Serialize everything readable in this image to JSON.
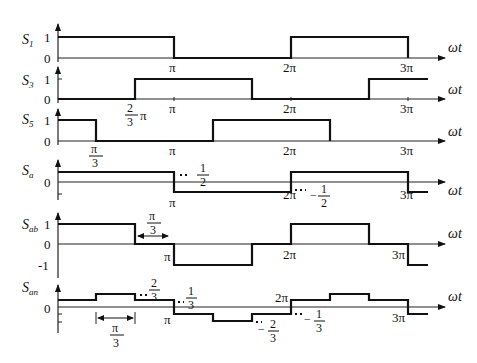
{
  "diagram": {
    "axis_label": "ωt",
    "x_ticks": [
      "π",
      "2π",
      "3π"
    ],
    "panels": [
      {
        "id": "S1",
        "label_main": "S",
        "label_sub": "1",
        "y_ticks": [
          "1",
          "0"
        ],
        "levels": [
          1,
          0,
          1,
          0
        ],
        "breakpoints": [
          "0",
          "π",
          "2π",
          "3π"
        ]
      },
      {
        "id": "S3",
        "label_main": "S",
        "label_sub": "3",
        "y_ticks": [
          "1",
          "0"
        ],
        "annotation": "2/3 π",
        "annotation_num": "2",
        "annotation_den": "3",
        "annotation_suffix": "π"
      },
      {
        "id": "S5",
        "label_main": "S",
        "label_sub": "5",
        "y_ticks": [
          "1",
          "0"
        ],
        "annotation": "π/3",
        "annotation_num": "π",
        "annotation_den": "3"
      },
      {
        "id": "Sa",
        "label_main": "S",
        "label_sub": "a",
        "y_ticks": [
          "0"
        ],
        "annotation_pos": "1/2",
        "annotation_pos_num": "1",
        "annotation_pos_den": "2",
        "annotation_neg": "-1/2",
        "annotation_neg_sign": "−",
        "annotation_neg_num": "1",
        "annotation_neg_den": "2"
      },
      {
        "id": "Sab",
        "label_main": "S",
        "label_sub": "ab",
        "y_ticks": [
          "1",
          "0",
          "-1"
        ],
        "interval": "π/3",
        "interval_num": "π",
        "interval_den": "3"
      },
      {
        "id": "San",
        "label_main": "S",
        "label_sub": "an",
        "y_ticks": [
          "0"
        ],
        "level_2_3": "2/3",
        "l23_num": "2",
        "l23_den": "3",
        "level_1_3": "1/3",
        "l13_num": "1",
        "l13_den": "3",
        "level_neg_2_3": "-2/3",
        "ln23_sign": "−",
        "ln23_num": "2",
        "ln23_den": "3",
        "level_neg_1_3": "-1/3",
        "ln13_sign": "−",
        "ln13_num": "1",
        "ln13_den": "3",
        "interval": "π/3",
        "interval_num": "π",
        "interval_den": "3"
      }
    ]
  }
}
